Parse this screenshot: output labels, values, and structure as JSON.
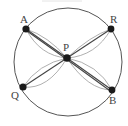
{
  "diagram": {
    "nodes": [
      {
        "id": "A",
        "label": "A"
      },
      {
        "id": "R",
        "label": "R"
      },
      {
        "id": "P",
        "label": "P"
      },
      {
        "id": "Q",
        "label": "Q"
      },
      {
        "id": "B",
        "label": "B"
      }
    ],
    "edges": [
      {
        "from": "A",
        "to": "P",
        "type": "straight-double"
      },
      {
        "from": "P",
        "to": "B",
        "type": "straight-double"
      },
      {
        "from": "R",
        "to": "P",
        "type": "straight"
      },
      {
        "from": "P",
        "to": "Q",
        "type": "straight"
      },
      {
        "from": "A",
        "to": "P",
        "type": "curved"
      },
      {
        "from": "R",
        "to": "P",
        "type": "curved"
      },
      {
        "from": "Q",
        "to": "P",
        "type": "curved"
      },
      {
        "from": "B",
        "to": "P",
        "type": "curved"
      }
    ],
    "enclosing_shape": "circle",
    "colors": {
      "node": "#1a1a1a",
      "line": "#444444",
      "arc": "#9a9a9a",
      "circle": "#555555"
    }
  }
}
